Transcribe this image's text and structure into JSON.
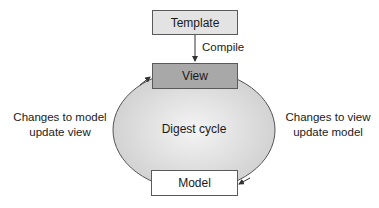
{
  "diagram": {
    "nodes": {
      "template": {
        "label": "Template",
        "fill": "#e3e3e3"
      },
      "view": {
        "label": "View",
        "fill": "#a8a8a8"
      },
      "model": {
        "label": "Model",
        "fill": "#ffffff"
      }
    },
    "edges": {
      "compile": {
        "from": "template",
        "to": "view",
        "label": "Compile"
      },
      "model_to_view": {
        "from": "model",
        "to": "view",
        "label_line1": "Changes to model",
        "label_line2": "update view"
      },
      "view_to_model": {
        "from": "view",
        "to": "model",
        "label_line1": "Changes to view",
        "label_line2": "update model"
      }
    },
    "cycle": {
      "label": "Digest cycle",
      "fill": "#d9d9d9"
    }
  }
}
